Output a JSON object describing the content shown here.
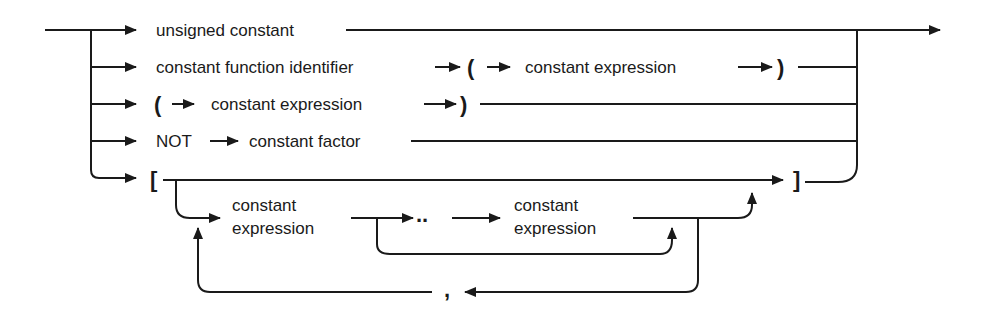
{
  "diagram": {
    "type": "syntax-diagram",
    "subject": "constant factor",
    "line_color": "#1a1a1a",
    "background": "#ffffff",
    "alternatives": [
      {
        "id": "alt-1",
        "label": "unsigned constant",
        "sequence": [
          "unsigned constant"
        ]
      },
      {
        "id": "alt-2",
        "label": "constant function identifier",
        "open_paren": "(",
        "inner": "constant expression",
        "close_paren": ")",
        "sequence": [
          "constant function identifier",
          "(",
          "constant expression",
          ")"
        ]
      },
      {
        "id": "alt-3",
        "open_paren": "(",
        "inner": "constant expression",
        "close_paren": ")",
        "sequence": [
          "(",
          "constant expression",
          ")"
        ]
      },
      {
        "id": "alt-4",
        "keyword": "NOT",
        "target": "constant factor",
        "sequence": [
          "NOT",
          "constant factor"
        ]
      },
      {
        "id": "alt-5",
        "open_bracket": "[",
        "close_bracket": "]",
        "element_start_line1": "constant",
        "element_start_line2": "expression",
        "range_operator": "..",
        "element_end_line1": "constant",
        "element_end_line2": "expression",
        "separator": ",",
        "sequence": [
          "[",
          "{ constant expression [ .. constant expression ] } separated by ,",
          "]"
        ]
      }
    ]
  }
}
